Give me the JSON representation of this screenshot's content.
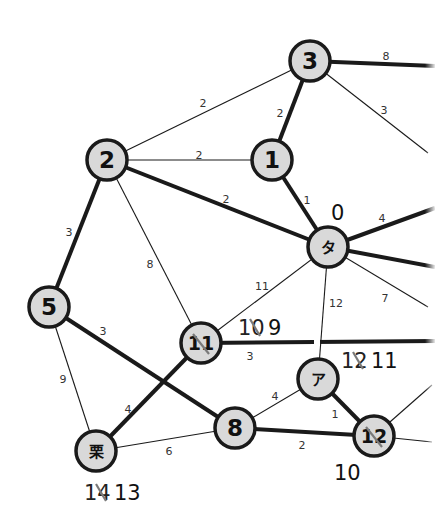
{
  "diagram": {
    "type": "weighted-graph",
    "colors": {
      "node_fill": "#d9d9d9",
      "node_stroke": "#1a1a1a",
      "edge": "#1a1a1a",
      "background": "#ffffff",
      "strike": "#7a7a7a"
    },
    "nodes": [
      {
        "id": "n3",
        "label": "3",
        "x": 310,
        "y": 61
      },
      {
        "id": "n1",
        "label": "1",
        "x": 272,
        "y": 160
      },
      {
        "id": "n2",
        "label": "2",
        "x": 107,
        "y": 160
      },
      {
        "id": "nta",
        "label": "タ",
        "x": 328,
        "y": 247
      },
      {
        "id": "n5",
        "label": "5",
        "x": 49,
        "y": 307
      },
      {
        "id": "n11",
        "label": "11",
        "x": 201,
        "y": 343,
        "struck": true
      },
      {
        "id": "na",
        "label": "ア",
        "x": 318,
        "y": 379
      },
      {
        "id": "n8",
        "label": "8",
        "x": 235,
        "y": 428
      },
      {
        "id": "n12",
        "label": "12",
        "x": 374,
        "y": 436,
        "struck": true
      },
      {
        "id": "nkuri",
        "label": "栗",
        "x": 96,
        "y": 451
      }
    ],
    "edges": [
      {
        "from": "n3",
        "to": "right_edge_1",
        "x2": 435,
        "y2": 66,
        "weight": "8",
        "bold": true,
        "lx": 386,
        "ly": 57
      },
      {
        "from": "n3",
        "to": "right_edge_2",
        "x2": 428,
        "y2": 153,
        "weight": "3",
        "bold": false,
        "lx": 384,
        "ly": 111
      },
      {
        "from": "n2",
        "to": "n3",
        "weight": "2",
        "bold": false,
        "lx": 203,
        "ly": 104
      },
      {
        "from": "n3",
        "to": "n1",
        "weight": "2",
        "bold": true,
        "lx": 280,
        "ly": 114
      },
      {
        "from": "n2",
        "to": "n1",
        "weight": "2",
        "bold": false,
        "lx": 199,
        "ly": 156
      },
      {
        "from": "n1",
        "to": "nta",
        "weight": "1",
        "bold": true,
        "lx": 307,
        "ly": 201
      },
      {
        "from": "n2",
        "to": "nta",
        "weight": "2",
        "bold": true,
        "lx": 226,
        "ly": 200
      },
      {
        "from": "nta",
        "to": "right_edge_3",
        "x2": 435,
        "y2": 208,
        "weight": "4",
        "bold": true,
        "lx": 382,
        "ly": 219
      },
      {
        "from": "nta",
        "to": "right_edge_4",
        "x2": 435,
        "y2": 267,
        "weight": "",
        "bold": true
      },
      {
        "from": "nta",
        "to": "right_edge_5",
        "x2": 428,
        "y2": 307,
        "weight": "7",
        "bold": false,
        "lx": 385,
        "ly": 299
      },
      {
        "from": "n2",
        "to": "n5",
        "weight": "3",
        "bold": true,
        "lx": 69,
        "ly": 233
      },
      {
        "from": "n2",
        "to": "n11",
        "weight": "8",
        "bold": false,
        "lx": 150,
        "ly": 265
      },
      {
        "from": "nta",
        "to": "n11",
        "weight": "11",
        "bold": false,
        "lx": 262,
        "ly": 287
      },
      {
        "from": "nta",
        "to": "na",
        "weight": "12",
        "bold": false,
        "lx": 336,
        "ly": 304
      },
      {
        "from": "n11",
        "to": "right_edge_6",
        "x2": 435,
        "y2": 341,
        "weight": "3",
        "bold": true,
        "lx": 250,
        "ly": 357
      },
      {
        "from": "n5",
        "to": "n8",
        "weight": "3",
        "bold": true,
        "lx": 103,
        "ly": 332
      },
      {
        "from": "n5",
        "to": "nkuri",
        "weight": "9",
        "bold": false,
        "lx": 63,
        "ly": 380
      },
      {
        "from": "n11",
        "to": "nkuri",
        "weight": "4",
        "bold": true,
        "lx": 128,
        "ly": 410
      },
      {
        "from": "na",
        "to": "n8",
        "weight": "4",
        "bold": false,
        "lx": 275,
        "ly": 397
      },
      {
        "from": "na",
        "to": "n12",
        "weight": "1",
        "bold": true,
        "lx": 335,
        "ly": 415
      },
      {
        "from": "nkuri",
        "to": "n8",
        "weight": "6",
        "bold": false,
        "lx": 169,
        "ly": 452
      },
      {
        "from": "n8",
        "to": "n12",
        "weight": "2",
        "bold": true,
        "lx": 302,
        "ly": 446
      },
      {
        "from": "n12",
        "to": "right_edge_7",
        "x2": 432,
        "y2": 385,
        "weight": "",
        "bold": false
      },
      {
        "from": "n12",
        "to": "right_edge_8",
        "x2": 432,
        "y2": 442,
        "weight": "",
        "bold": false
      }
    ],
    "annotations": [
      {
        "id": "ann-ta",
        "struck": "",
        "value": "0",
        "x": 331,
        "y": 220
      },
      {
        "id": "ann-11",
        "struck": "10",
        "value": "9",
        "x": 238,
        "y": 335
      },
      {
        "id": "ann-a",
        "struck": "12",
        "value": "11",
        "x": 341,
        "y": 368
      },
      {
        "id": "ann-12",
        "struck": "",
        "value": "10",
        "x": 334,
        "y": 480
      },
      {
        "id": "ann-kuri",
        "struck": "14",
        "value": "13",
        "x": 84,
        "y": 500
      }
    ]
  }
}
